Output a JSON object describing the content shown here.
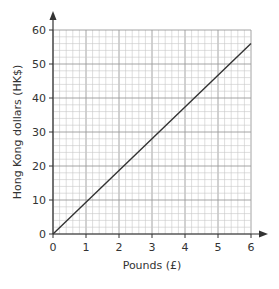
{
  "chart_data": {
    "type": "line",
    "title": "",
    "xlabel": "Pounds (£)",
    "ylabel": "Hong Kong dollars (HK$)",
    "xlim": [
      0,
      6
    ],
    "ylim": [
      0,
      60
    ],
    "x_ticks": [
      0,
      1,
      2,
      3,
      4,
      5,
      6
    ],
    "y_ticks": [
      0,
      10,
      20,
      30,
      40,
      50,
      60
    ],
    "x_minor_step": 0.2,
    "y_minor_step": 2,
    "grid": true,
    "legend": null,
    "series": [
      {
        "name": "conversion",
        "x": [
          0,
          6
        ],
        "y": [
          0,
          56
        ]
      }
    ]
  },
  "colors": {
    "grid_minor": "#c8c8c8",
    "grid_major": "#9a9a9a",
    "axis": "#333333",
    "line": "#333333"
  }
}
